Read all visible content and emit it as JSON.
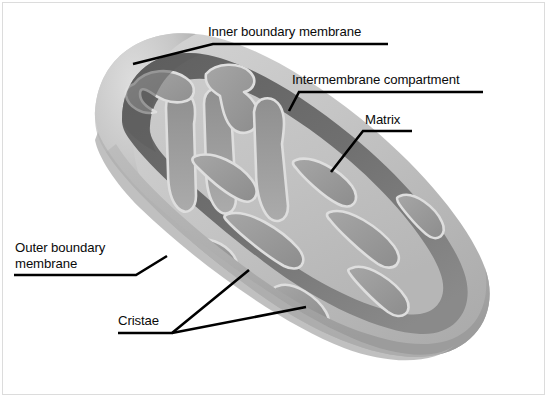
{
  "figure": {
    "background_color": "#ffffff",
    "frame_border_color": "#dcdcdc",
    "leader_line_color": "#000000",
    "palette": {
      "outer_membrane_light": "#c9c9c9",
      "outer_membrane_rim": "#b4b4b4",
      "outer_membrane_shadow": "#a0a0a0",
      "intermembrane_dark": "#6f6f6f",
      "intermembrane_mid": "#848484",
      "matrix_light": "#c3c3c3",
      "cristae_mid": "#9a9a9a",
      "cristae_highlight": "#dedede",
      "cut_face_dark": "#5c5c5c"
    }
  },
  "labels": {
    "inner_boundary_membrane": "Inner boundary membrane",
    "intermembrane_compartment": "Intermembrane compartment",
    "matrix": "Matrix",
    "outer_boundary_membrane_line1": "Outer boundary",
    "outer_boundary_membrane_line2": "membrane",
    "cristae": "Cristae"
  }
}
